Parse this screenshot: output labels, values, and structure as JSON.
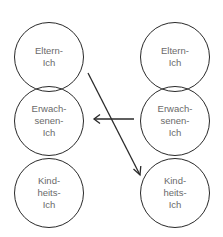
{
  "diagram": {
    "type": "transactional-analysis-ego-states",
    "left_column": [
      {
        "id": "left-parent",
        "lines": [
          "Eltern-",
          "Ich"
        ]
      },
      {
        "id": "left-adult",
        "lines": [
          "Erwach-",
          "senen-",
          "Ich"
        ]
      },
      {
        "id": "left-child",
        "lines": [
          "Kind-",
          "heits-",
          "Ich"
        ]
      }
    ],
    "right_column": [
      {
        "id": "right-parent",
        "lines": [
          "Eltern-",
          "Ich"
        ]
      },
      {
        "id": "right-adult",
        "lines": [
          "Erwach-",
          "senen-",
          "Ich"
        ]
      },
      {
        "id": "right-child",
        "lines": [
          "Kind-",
          "heits-",
          "Ich"
        ]
      }
    ],
    "arrows": [
      {
        "from": "left-parent",
        "to": "right-child",
        "direction": "diagonal-down-right"
      },
      {
        "from": "right-adult",
        "to": "left-adult",
        "direction": "horizontal-left"
      }
    ],
    "colors": {
      "stroke": "#2a2a2a",
      "text": "#6a6a6a",
      "background": "#ffffff"
    }
  }
}
